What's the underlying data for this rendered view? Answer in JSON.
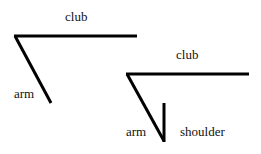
{
  "figure1": {
    "club_label": "club",
    "arm_label": "arm"
  },
  "figure2": {
    "club_label": "club",
    "arm_label": "arm",
    "shoulder_label": "shoulder"
  },
  "colors": {
    "line": "#000000",
    "text": "#111111",
    "background": "#ffffff"
  }
}
